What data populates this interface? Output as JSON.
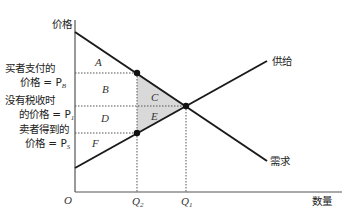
{
  "diagram": {
    "y_axis_label": "价格",
    "x_axis_label": "数量",
    "origin_label": "O",
    "curves": {
      "supply_label": "供给",
      "demand_label": "需求"
    },
    "price_labels": {
      "buyer_line1": "买者支付的",
      "buyer_line2": "价格 = P",
      "buyer_sub": "B",
      "notax_line1": "没有税收时",
      "notax_line2": "的价格 = P",
      "notax_sub": "1",
      "seller_line1": "卖者得到的",
      "seller_line2": "价格 = P",
      "seller_sub": "S"
    },
    "quantity_labels": {
      "q2": "Q",
      "q2_sub": "2",
      "q1": "Q",
      "q1_sub": "1"
    },
    "areas": [
      "A",
      "B",
      "C",
      "D",
      "E",
      "F"
    ],
    "colors": {
      "line": "#1a1a1a",
      "deadweight_fill": "#d9d9d9",
      "axis": "#555555"
    }
  }
}
